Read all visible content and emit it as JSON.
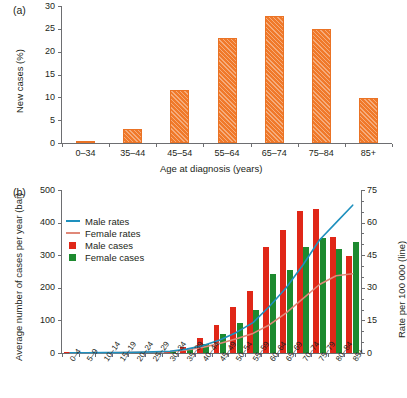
{
  "figure": {
    "panel_a_tag": "(a)",
    "panel_b_tag": "(b)"
  },
  "chart_data": [
    {
      "id": "panel_a",
      "type": "bar",
      "title": "",
      "panel_label": "(a)",
      "xlabel": "Age at diagnosis (years)",
      "ylabel": "New cases (%)",
      "categories": [
        "0–34",
        "35–44",
        "45–54",
        "55–64",
        "65–74",
        "75–84",
        "85+"
      ],
      "values": [
        0.5,
        3.0,
        11.5,
        23.0,
        27.8,
        25.0,
        9.8
      ],
      "ylim": [
        0,
        30
      ],
      "yticks": [
        0,
        5,
        10,
        15,
        20,
        25,
        30
      ],
      "ytick_labels": [
        "0",
        "5",
        "10",
        "15",
        "20",
        "25",
        "30"
      ],
      "grid": false,
      "legend": "none",
      "series_color": "#f0792a",
      "bar_pattern": "diagonal-hatch"
    },
    {
      "id": "panel_b",
      "type": "bar+line",
      "title": "",
      "panel_label": "(b)",
      "xlabel": "",
      "ylabel": "Average number of cases per year (bar)",
      "y2label": "Rate per 100 000 (line)",
      "categories": [
        "0–4",
        "5–9",
        "10–14",
        "15–19",
        "20–24",
        "25–29",
        "30–34",
        "35–39",
        "40–44",
        "45–49",
        "50–54",
        "55–59",
        "60–64",
        "65–69",
        "70–74",
        "75–79",
        "80–84",
        "85+"
      ],
      "ylim": [
        0,
        500
      ],
      "yticks": [
        0,
        100,
        200,
        300,
        400,
        500
      ],
      "ytick_labels": [
        "0",
        "100",
        "200",
        "300",
        "400",
        "500"
      ],
      "y2lim": [
        0,
        75
      ],
      "y2ticks": [
        0,
        15,
        30,
        45,
        60,
        75
      ],
      "y2tick_labels": [
        "0",
        "15",
        "30",
        "45",
        "60",
        "75"
      ],
      "grid": false,
      "legend_position": "upper-left",
      "series": [
        {
          "name": "Male cases",
          "kind": "bar",
          "axis": "left",
          "color": "#e02718",
          "values": [
            1,
            1,
            2,
            2,
            3,
            4,
            6,
            18,
            45,
            86,
            142,
            189,
            326,
            376,
            437,
            441,
            357,
            299
          ]
        },
        {
          "name": "Female cases",
          "kind": "bar",
          "axis": "left",
          "color": "#1d8a2f",
          "values": [
            1,
            1,
            1,
            2,
            3,
            4,
            7,
            14,
            28,
            59,
            92,
            131,
            241,
            255,
            325,
            353,
            319,
            340
          ]
        },
        {
          "name": "Male rates",
          "kind": "line",
          "axis": "right",
          "color": "#1e90be",
          "values": [
            0.1,
            0.1,
            0.2,
            0.2,
            0.3,
            0.5,
            0.8,
            1.8,
            3.4,
            6.0,
            9.5,
            14.0,
            21.5,
            30.0,
            40.5,
            52.0,
            60.0,
            68.0
          ]
        },
        {
          "name": "Female rates",
          "kind": "line",
          "axis": "right",
          "color": "#e08878",
          "values": [
            0.1,
            0.1,
            0.1,
            0.2,
            0.3,
            0.4,
            0.7,
            1.4,
            2.6,
            4.4,
            6.6,
            9.0,
            13.0,
            18.5,
            25.0,
            31.5,
            35.5,
            36.5
          ]
        }
      ],
      "legend_entries": [
        {
          "label": "Male rates",
          "marker": "line",
          "color": "#1e90be"
        },
        {
          "label": "Female rates",
          "marker": "line",
          "color": "#e08878"
        },
        {
          "label": "Male cases",
          "marker": "box",
          "color": "#e02718"
        },
        {
          "label": "Female cases",
          "marker": "box",
          "color": "#1d8a2f"
        }
      ]
    }
  ],
  "colors": {
    "orange": "#f0792a",
    "red": "#e02718",
    "green": "#1d8a2f",
    "blue": "#1e90be",
    "salmon": "#e08878",
    "axis": "#6d6e71",
    "text": "#231f20"
  }
}
